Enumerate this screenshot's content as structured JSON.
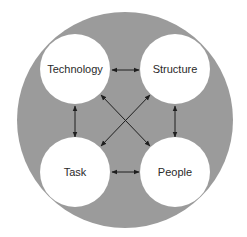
{
  "diagram": {
    "type": "interaction-model",
    "colors": {
      "background": "#ffffff",
      "outer_circle": "#9b9b9b",
      "node_fill": "#ffffff",
      "arrow": "#1e1e1e",
      "text": "#2a2a2a"
    },
    "nodes": [
      {
        "id": "technology",
        "label": "Technology",
        "position": "top-left"
      },
      {
        "id": "structure",
        "label": "Structure",
        "position": "top-right"
      },
      {
        "id": "task",
        "label": "Task",
        "position": "bottom-left"
      },
      {
        "id": "people",
        "label": "People",
        "position": "bottom-right"
      }
    ],
    "edges": [
      {
        "from": "technology",
        "to": "structure",
        "direction": "bidirectional"
      },
      {
        "from": "task",
        "to": "people",
        "direction": "bidirectional"
      },
      {
        "from": "technology",
        "to": "task",
        "direction": "bidirectional"
      },
      {
        "from": "structure",
        "to": "people",
        "direction": "bidirectional"
      },
      {
        "from": "technology",
        "to": "people",
        "direction": "bidirectional"
      },
      {
        "from": "structure",
        "to": "task",
        "direction": "bidirectional"
      }
    ]
  }
}
